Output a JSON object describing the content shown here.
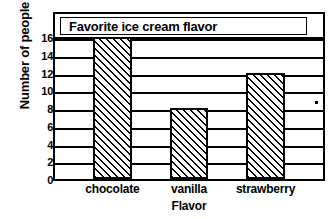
{
  "chart_data": {
    "type": "bar",
    "title": "Favorite ice cream flavor",
    "xlabel": "Flavor",
    "ylabel": "Number of people",
    "categories": [
      "chocolate",
      "vanilla",
      "strawberry"
    ],
    "values": [
      16,
      8,
      12
    ],
    "ylim": [
      0,
      16
    ],
    "ytick_labels": [
      "16",
      "14",
      "12",
      "10",
      "8",
      "6",
      "4",
      "2",
      "0"
    ],
    "ytick_values": [
      16,
      14,
      12,
      10,
      8,
      6,
      4,
      2,
      0
    ],
    "ytick_step": 2,
    "grid": true,
    "legend": false,
    "bar_fill": "diagonal-hatch",
    "colors": {
      "line": "#000000",
      "background": "#ffffff",
      "bar_fill": "#ffffff"
    },
    "annotations": [
      "scan-dot-artifact"
    ]
  }
}
